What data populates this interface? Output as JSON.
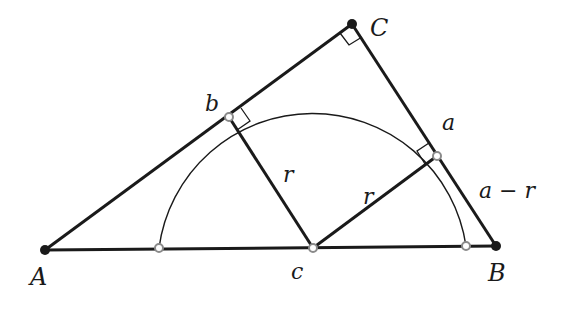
{
  "diagram": {
    "type": "geometry",
    "colors": {
      "stroke": "#1a1a1a",
      "point": "#1a1a1a",
      "tangent_point": "#8a8a8a",
      "background": "#ffffff"
    },
    "points": {
      "A": {
        "label": "A",
        "x": 45,
        "y": 250
      },
      "B": {
        "label": "B",
        "x": 496,
        "y": 246
      },
      "C": {
        "label": "C",
        "x": 352,
        "y": 24
      },
      "c": {
        "label": "c",
        "x": 313,
        "y": 248
      },
      "b": {
        "label": "b",
        "x": 229,
        "y": 117
      },
      "a": {
        "label": "a",
        "x": 437,
        "y": 156
      }
    },
    "radius": 155,
    "labels": {
      "A": "A",
      "B": "B",
      "C": "C",
      "a": "a",
      "b": "b",
      "c": "c",
      "r1": "r",
      "r2": "r",
      "a_minus_r": "a − r"
    }
  }
}
